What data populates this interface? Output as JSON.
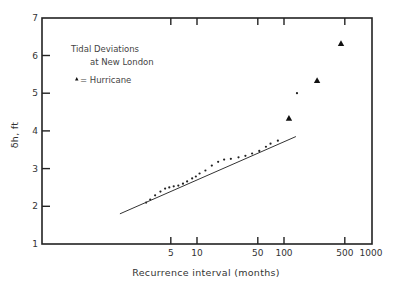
{
  "chart_data": {
    "type": "scatter",
    "title": "Tidal Deviations at New London",
    "xlabel": "Recurrence interval (months)",
    "ylabel": "δh, ft",
    "x_scale": "log",
    "xlim": [
      1,
      1000
    ],
    "ylim": [
      1,
      7
    ],
    "x_ticks": [
      5,
      10,
      50,
      100,
      500,
      1000
    ],
    "x_tick_labels": [
      "5",
      "10",
      "50",
      "100",
      "500",
      "1000"
    ],
    "y_ticks": [
      1,
      2,
      3,
      4,
      5,
      6,
      7
    ],
    "y_tick_labels": [
      "1",
      "2",
      "3",
      "4",
      "5",
      "6",
      "7"
    ],
    "grid": false,
    "legend": {
      "title_line1": "Tidal Deviations",
      "title_line2": "at New London",
      "entries": [
        {
          "symbol": "triangle",
          "label": "= Hurricane"
        }
      ],
      "position": "upper-left"
    },
    "series": [
      {
        "name": "Observed tidal deviations",
        "marker": "dot",
        "points": [
          [
            2.6,
            2.1
          ],
          [
            2.9,
            2.18
          ],
          [
            3.3,
            2.29
          ],
          [
            3.8,
            2.39
          ],
          [
            4.3,
            2.47
          ],
          [
            4.8,
            2.5
          ],
          [
            5.4,
            2.53
          ],
          [
            6.1,
            2.55
          ],
          [
            6.9,
            2.6
          ],
          [
            7.7,
            2.66
          ],
          [
            8.8,
            2.74
          ],
          [
            9.7,
            2.79
          ],
          [
            10.7,
            2.87
          ],
          [
            12.5,
            2.95
          ],
          [
            14.8,
            3.08
          ],
          [
            17.5,
            3.18
          ],
          [
            20.5,
            3.24
          ],
          [
            24.5,
            3.26
          ],
          [
            30.0,
            3.3
          ],
          [
            36.0,
            3.34
          ],
          [
            43.0,
            3.4
          ],
          [
            52.0,
            3.47
          ],
          [
            62.0,
            3.58
          ],
          [
            70.0,
            3.66
          ],
          [
            85.0,
            3.74
          ]
        ]
      },
      {
        "name": "Fitted line",
        "type": "line",
        "points": [
          [
            1.3,
            1.8
          ],
          [
            137,
            3.85
          ]
        ]
      },
      {
        "name": "Hurricane",
        "marker": "triangle",
        "points": [
          [
            114,
            4.34
          ],
          [
            240,
            5.34
          ],
          [
            452,
            6.32
          ]
        ]
      },
      {
        "name": "Isolated observation",
        "marker": "dot",
        "points": [
          [
            141,
            5.0
          ]
        ]
      }
    ]
  }
}
